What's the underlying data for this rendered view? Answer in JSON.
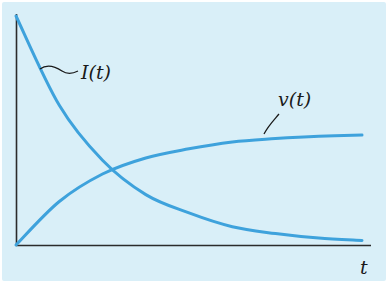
{
  "chart_data": {
    "type": "line",
    "title": "",
    "xlabel": "t",
    "ylabel": "",
    "grid": false,
    "legend": "inline curve labels",
    "x": [
      0,
      0.5,
      1,
      1.5,
      2,
      2.5,
      3,
      3.5,
      4
    ],
    "series": [
      {
        "name": "I(t)",
        "description": "decaying exponential",
        "values": [
          1.0,
          0.61,
          0.37,
          0.22,
          0.14,
          0.08,
          0.05,
          0.03,
          0.02
        ]
      },
      {
        "name": "v(t)",
        "description": "rising exponential toward steady state",
        "values": [
          0.0,
          0.19,
          0.31,
          0.38,
          0.42,
          0.45,
          0.465,
          0.475,
          0.48
        ]
      }
    ],
    "xlim": [
      0,
      4
    ],
    "ylim": [
      0,
      1
    ],
    "colors": {
      "curves": "#3ea2dc",
      "axes": "#2b2b2b",
      "background": "#d9eff8"
    }
  },
  "labels": {
    "current": "I(t)",
    "voltage": "v(t)",
    "x_axis": "t"
  }
}
